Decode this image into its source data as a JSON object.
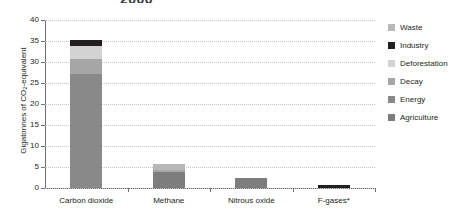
{
  "chart_data": {
    "type": "bar",
    "title": "2000",
    "subtitle": "",
    "xlabel": "",
    "ylabel": "Gigatonnes of CO2-equivalent",
    "ylabel_prefix": "Gigatonnes of CO",
    "ylabel_sub": "2",
    "ylabel_suffix": "-equivalent",
    "ylim": [
      0,
      40
    ],
    "yticks": [
      0,
      5,
      10,
      15,
      20,
      25,
      30,
      35,
      40
    ],
    "ytick_labels": [
      "0",
      "5",
      "10",
      "15",
      "20",
      "25",
      "30",
      "35",
      "40"
    ],
    "grid": true,
    "legend_position": "right",
    "stacked": true,
    "categories": [
      "Carbon dioxide",
      "Methane",
      "Nitrous oxide",
      "F-gases*"
    ],
    "series": [
      {
        "name": "Agriculture",
        "color": "#7d7d7d",
        "values": [
          0,
          3.8,
          2.3,
          0
        ]
      },
      {
        "name": "Energy",
        "color": "#898989",
        "values": [
          27.2,
          0,
          0,
          0
        ]
      },
      {
        "name": "Decay",
        "color": "#a6a6a6",
        "values": [
          3.5,
          0.6,
          0,
          0
        ]
      },
      {
        "name": "Deforestation",
        "color": "#d3d3d3",
        "values": [
          3.2,
          0,
          0,
          0
        ]
      },
      {
        "name": "Industry",
        "color": "#231f20",
        "values": [
          1.3,
          0,
          0,
          0.6
        ]
      },
      {
        "name": "Waste",
        "color": "#b8b8b8",
        "values": [
          0,
          1.3,
          0,
          0
        ]
      }
    ],
    "totals": [
      35.2,
      5.7,
      2.3,
      0.6
    ],
    "notes": "F-gases*"
  },
  "legend": {
    "items": [
      {
        "label": "Waste",
        "color": "#b8b8b8"
      },
      {
        "label": "Industry",
        "color": "#231f20"
      },
      {
        "label": "Deforestation",
        "color": "#d3d3d3"
      },
      {
        "label": "Decay",
        "color": "#a6a6a6"
      },
      {
        "label": "Energy",
        "color": "#898989"
      },
      {
        "label": "Agriculture",
        "color": "#7d7d7d"
      }
    ]
  }
}
